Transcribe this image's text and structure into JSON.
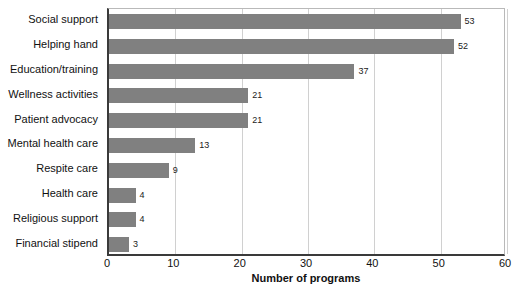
{
  "chart_data": {
    "type": "bar",
    "orientation": "horizontal",
    "title": "",
    "subtitle": "",
    "xlabel": "Number of programs",
    "ylabel": "",
    "xlim": [
      0,
      60
    ],
    "xticks": [
      0,
      10,
      20,
      30,
      40,
      50,
      60
    ],
    "xtick_labels": [
      "0",
      "10",
      "20",
      "30",
      "40",
      "50",
      "60"
    ],
    "grid": "vertical",
    "legend": "none",
    "bar_color": "#808080",
    "axis_color": "#3a3a3a",
    "gridline_color": "#d0d0d0",
    "categories": [
      "Social support",
      "Helping hand",
      "Education/training",
      "Wellness activities",
      "Patient advocacy",
      "Mental health care",
      "Respite care",
      "Health care",
      "Religious support",
      "Financial stipend"
    ],
    "values": [
      53,
      52,
      37,
      21,
      21,
      13,
      9,
      4,
      4,
      3
    ],
    "value_labels": [
      "53",
      "52",
      "37",
      "21",
      "21",
      "13",
      "9",
      "4",
      "4",
      "3"
    ]
  }
}
